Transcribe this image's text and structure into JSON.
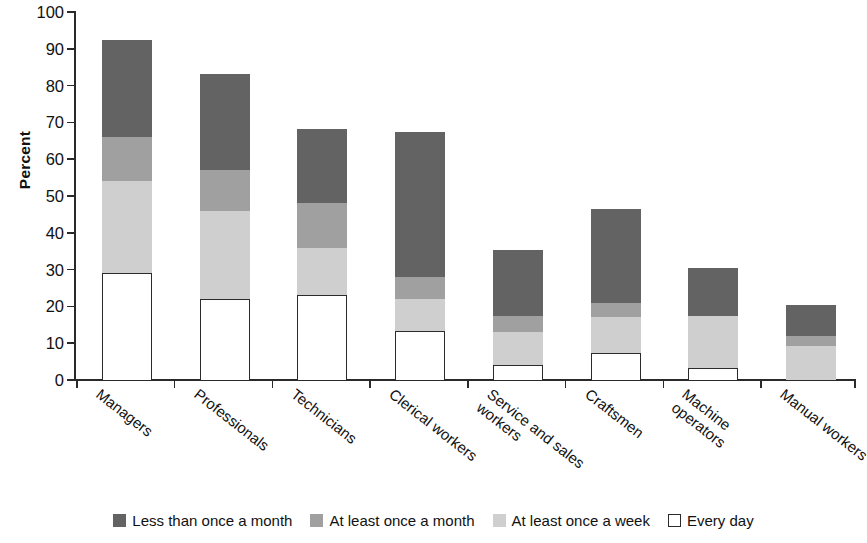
{
  "chart_data": {
    "type": "bar",
    "subtype": "stacked-vertical",
    "title": "",
    "xlabel": "",
    "ylabel": "Percent",
    "ylim": [
      0,
      100
    ],
    "ytick_step": 10,
    "yticks": [
      0,
      10,
      20,
      30,
      40,
      50,
      60,
      70,
      80,
      90,
      100
    ],
    "ytick_labels": [
      "0",
      "10",
      "20",
      "30",
      "40",
      "50",
      "60",
      "70",
      "80",
      "90",
      "100"
    ],
    "grid": false,
    "legend_position": "bottom",
    "stack_order_bottom_to_top": [
      "Every day",
      "At least once a week",
      "At least once a month",
      "Less than once a month"
    ],
    "categories": [
      "Managers",
      "Professionals",
      "Technicians",
      "Clerical workers",
      "Service and sales\nworkers",
      "Craftsmen",
      "Machine\noperators",
      "Manual workers"
    ],
    "series": [
      {
        "name": "Less than once a month",
        "color": "#636363",
        "values": [
          26.3,
          26.3,
          20.3,
          39.3,
          17.8,
          25.5,
          13.0,
          8.5
        ]
      },
      {
        "name": "At least once a month",
        "color": "#a0a0a0",
        "values": [
          12.0,
          11.0,
          12.0,
          6.0,
          4.5,
          4.0,
          0.0,
          2.8
        ]
      },
      {
        "name": "At least once a week",
        "color": "#cfcfcf",
        "values": [
          24.8,
          23.9,
          12.8,
          8.7,
          8.8,
          9.6,
          14.3,
          9.2
        ]
      },
      {
        "name": "Every day",
        "color": "#ffffff",
        "values": [
          29.2,
          22.1,
          23.2,
          13.3,
          4.2,
          7.4,
          3.2,
          0.0
        ]
      }
    ],
    "totals": [
      92.3,
      83.3,
      68.3,
      67.3,
      35.3,
      46.5,
      30.5,
      20.5
    ]
  },
  "legend": {
    "items": [
      {
        "label": "Less than once a month",
        "swatch": "swatch-less-than-once-a-month"
      },
      {
        "label": "At least once a month",
        "swatch": "swatch-at-least-once-a-month"
      },
      {
        "label": "At least once a week",
        "swatch": "swatch-at-least-once-a-week"
      },
      {
        "label": "Every day",
        "swatch": "swatch-every-day"
      }
    ]
  }
}
